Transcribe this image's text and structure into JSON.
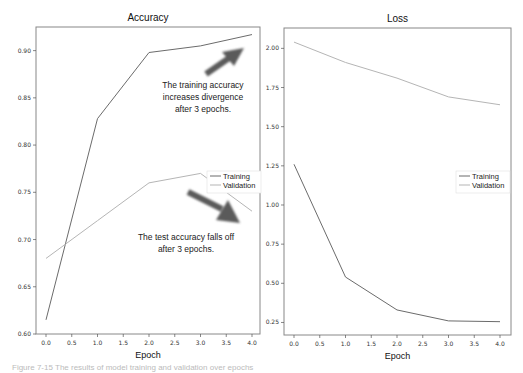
{
  "colors": {
    "training": "#6b6b6b",
    "validation": "#b5b5b5",
    "frame": "#888888",
    "arrow": "#5a5a5a"
  },
  "chart_data": [
    {
      "type": "line",
      "title": "Accuracy",
      "xlabel": "Epoch",
      "ylabel": "",
      "x": [
        0,
        1,
        2,
        3,
        4
      ],
      "xticks": [
        "0.0",
        "0.5",
        "1.0",
        "1.5",
        "2.0",
        "2.5",
        "3.0",
        "3.5",
        "4.0"
      ],
      "yticks": [
        "0.60",
        "0.65",
        "0.70",
        "0.75",
        "0.80",
        "0.85",
        "0.90"
      ],
      "xlim": [
        -0.2,
        4.1
      ],
      "ylim": [
        0.6,
        0.925
      ],
      "grid": false,
      "legend_position": "center right",
      "series": [
        {
          "name": "Training",
          "values": [
            0.615,
            0.828,
            0.898,
            0.905,
            0.917
          ]
        },
        {
          "name": "Validation",
          "values": [
            0.68,
            0.72,
            0.76,
            0.77,
            0.73
          ]
        }
      ],
      "annotations": [
        {
          "text": "The training accuracy increases divergence after 3 epochs.",
          "lines": [
            "The training accuracy",
            "increases divergence",
            "after 3 epochs."
          ]
        },
        {
          "text": "The test accuracy falls off after 3 epochs.",
          "lines": [
            "The test accuracy falls off",
            "after 3 epochs."
          ]
        }
      ]
    },
    {
      "type": "line",
      "title": "Loss",
      "xlabel": "Epoch",
      "ylabel": "",
      "x": [
        0,
        1,
        2,
        3,
        4
      ],
      "xticks": [
        "0.0",
        "0.5",
        "1.0",
        "1.5",
        "2.0",
        "2.5",
        "3.0",
        "3.5",
        "4.0"
      ],
      "yticks": [
        "0.25",
        "0.50",
        "0.75",
        "1.00",
        "1.25",
        "1.50",
        "1.75",
        "2.00"
      ],
      "xlim": [
        -0.2,
        4.1
      ],
      "ylim": [
        0.17,
        2.13
      ],
      "grid": false,
      "legend_position": "center right",
      "series": [
        {
          "name": "Training",
          "values": [
            1.26,
            0.54,
            0.33,
            0.26,
            0.255
          ]
        },
        {
          "name": "Validation",
          "values": [
            2.04,
            1.91,
            1.81,
            1.69,
            1.64
          ]
        }
      ]
    }
  ],
  "legend": {
    "training": "Training",
    "validation": "Validation"
  },
  "caption": "Figure 7-15  The results of model training and validation over epochs"
}
